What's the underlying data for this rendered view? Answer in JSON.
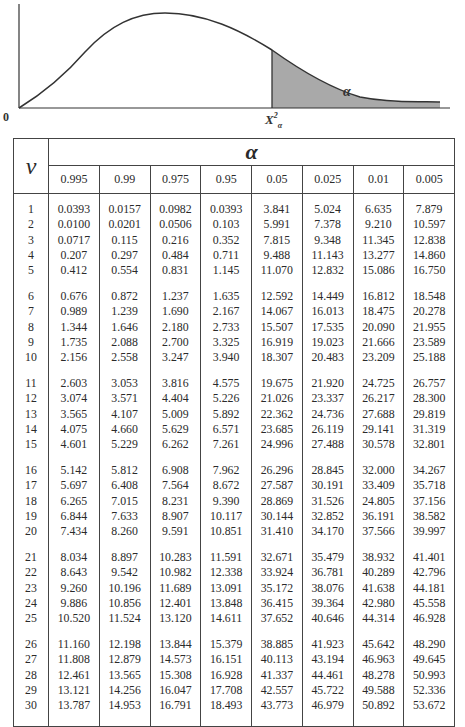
{
  "figure": {
    "origin_label": "0",
    "critical_value_label": "X",
    "critical_value_sup": "2",
    "critical_value_sub": "α",
    "shaded_area_label": "α",
    "shade_color": "#a9a9a9",
    "line_color": "#333333"
  },
  "table": {
    "nu_header": "ν",
    "alpha_header": "α",
    "alpha_levels": [
      "0.995",
      "0.99",
      "0.975",
      "0.95",
      "0.05",
      "0.025",
      "0.01",
      "0.005"
    ],
    "groups": [
      [
        {
          "nu": "1",
          "values": [
            "0.0393",
            "0.0157",
            "0.0982",
            "0.0393",
            "3.841",
            "5.024",
            "6.635",
            "7.879"
          ]
        },
        {
          "nu": "2",
          "values": [
            "0.0100",
            "0.0201",
            "0.0506",
            "0.103",
            "5.991",
            "7.378",
            "9.210",
            "10.597"
          ]
        },
        {
          "nu": "3",
          "values": [
            "0.0717",
            "0.115",
            "0.216",
            "0.352",
            "7.815",
            "9.348",
            "11.345",
            "12.838"
          ]
        },
        {
          "nu": "4",
          "values": [
            "0.207",
            "0.297",
            "0.484",
            "0.711",
            "9.488",
            "11.143",
            "13.277",
            "14.860"
          ]
        },
        {
          "nu": "5",
          "values": [
            "0.412",
            "0.554",
            "0.831",
            "1.145",
            "11.070",
            "12.832",
            "15.086",
            "16.750"
          ]
        }
      ],
      [
        {
          "nu": "6",
          "values": [
            "0.676",
            "0.872",
            "1.237",
            "1.635",
            "12.592",
            "14.449",
            "16.812",
            "18.548"
          ]
        },
        {
          "nu": "7",
          "values": [
            "0.989",
            "1.239",
            "1.690",
            "2.167",
            "14.067",
            "16.013",
            "18.475",
            "20.278"
          ]
        },
        {
          "nu": "8",
          "values": [
            "1.344",
            "1.646",
            "2.180",
            "2.733",
            "15.507",
            "17.535",
            "20.090",
            "21.955"
          ]
        },
        {
          "nu": "9",
          "values": [
            "1.735",
            "2.088",
            "2.700",
            "3.325",
            "16.919",
            "19.023",
            "21.666",
            "23.589"
          ]
        },
        {
          "nu": "10",
          "values": [
            "2.156",
            "2.558",
            "3.247",
            "3.940",
            "18.307",
            "20.483",
            "23.209",
            "25.188"
          ]
        }
      ],
      [
        {
          "nu": "11",
          "values": [
            "2.603",
            "3.053",
            "3.816",
            "4.575",
            "19.675",
            "21.920",
            "24.725",
            "26.757"
          ]
        },
        {
          "nu": "12",
          "values": [
            "3.074",
            "3.571",
            "4.404",
            "5.226",
            "21.026",
            "23.337",
            "26.217",
            "28.300"
          ]
        },
        {
          "nu": "13",
          "values": [
            "3.565",
            "4.107",
            "5.009",
            "5.892",
            "22.362",
            "24.736",
            "27.688",
            "29.819"
          ]
        },
        {
          "nu": "14",
          "values": [
            "4.075",
            "4.660",
            "5.629",
            "6.571",
            "23.685",
            "26.119",
            "29.141",
            "31.319"
          ]
        },
        {
          "nu": "15",
          "values": [
            "4.601",
            "5.229",
            "6.262",
            "7.261",
            "24.996",
            "27.488",
            "30.578",
            "32.801"
          ]
        }
      ],
      [
        {
          "nu": "16",
          "values": [
            "5.142",
            "5.812",
            "6.908",
            "7.962",
            "26.296",
            "28.845",
            "32.000",
            "34.267"
          ]
        },
        {
          "nu": "17",
          "values": [
            "5.697",
            "6.408",
            "7.564",
            "8.672",
            "27.587",
            "30.191",
            "33.409",
            "35.718"
          ]
        },
        {
          "nu": "18",
          "values": [
            "6.265",
            "7.015",
            "8.231",
            "9.390",
            "28.869",
            "31.526",
            "24.805",
            "37.156"
          ]
        },
        {
          "nu": "19",
          "values": [
            "6.844",
            "7.633",
            "8.907",
            "10.117",
            "30.144",
            "32.852",
            "36.191",
            "38.582"
          ]
        },
        {
          "nu": "20",
          "values": [
            "7.434",
            "8.260",
            "9.591",
            "10.851",
            "31.410",
            "34.170",
            "37.566",
            "39.997"
          ]
        }
      ],
      [
        {
          "nu": "21",
          "values": [
            "8.034",
            "8.897",
            "10.283",
            "11.591",
            "32.671",
            "35.479",
            "38.932",
            "41.401"
          ]
        },
        {
          "nu": "22",
          "values": [
            "8.643",
            "9.542",
            "10.982",
            "12.338",
            "33.924",
            "36.781",
            "40.289",
            "42.796"
          ]
        },
        {
          "nu": "23",
          "values": [
            "9.260",
            "10.196",
            "11.689",
            "13.091",
            "35.172",
            "38.076",
            "41.638",
            "44.181"
          ]
        },
        {
          "nu": "24",
          "values": [
            "9.886",
            "10.856",
            "12.401",
            "13.848",
            "36.415",
            "39.364",
            "42.980",
            "45.558"
          ]
        },
        {
          "nu": "25",
          "values": [
            "10.520",
            "11.524",
            "13.120",
            "14.611",
            "37.652",
            "40.646",
            "44.314",
            "46.928"
          ]
        }
      ],
      [
        {
          "nu": "26",
          "values": [
            "11.160",
            "12.198",
            "13.844",
            "15.379",
            "38.885",
            "41.923",
            "45.642",
            "48.290"
          ]
        },
        {
          "nu": "27",
          "values": [
            "11.808",
            "12.879",
            "14.573",
            "16.151",
            "40.113",
            "43.194",
            "46.963",
            "49.645"
          ]
        },
        {
          "nu": "28",
          "values": [
            "12.461",
            "13.565",
            "15.308",
            "16.928",
            "41.337",
            "44.461",
            "48.278",
            "50.993"
          ]
        },
        {
          "nu": "29",
          "values": [
            "13.121",
            "14.256",
            "16.047",
            "17.708",
            "42.557",
            "45.722",
            "49.588",
            "52.336"
          ]
        },
        {
          "nu": "30",
          "values": [
            "13.787",
            "14.953",
            "16.791",
            "18.493",
            "43.773",
            "46.979",
            "50.892",
            "53.672"
          ]
        }
      ]
    ]
  }
}
